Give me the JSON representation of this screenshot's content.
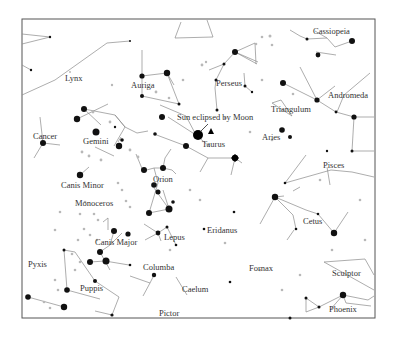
{
  "map": {
    "type": "star chart",
    "annotation": "Sun eclipsed by Moon",
    "frame": {
      "x": 22,
      "y": 19,
      "w": 353,
      "h": 299
    },
    "constellations": [
      {
        "name": "Cassiopeia",
        "x": 313,
        "y": 32
      },
      {
        "name": "Lynx",
        "x": 65,
        "y": 80
      },
      {
        "name": "Auriga",
        "x": 132,
        "y": 87
      },
      {
        "name": "Perseus",
        "x": 217,
        "y": 84
      },
      {
        "name": "Andromeda",
        "x": 328,
        "y": 97
      },
      {
        "name": "Triangulum",
        "x": 272,
        "y": 111
      },
      {
        "name": "Cancer",
        "x": 34,
        "y": 139
      },
      {
        "name": "Gemini",
        "x": 83,
        "y": 143
      },
      {
        "name": "Taurus",
        "x": 200,
        "y": 146
      },
      {
        "name": "Aries",
        "x": 262,
        "y": 139
      },
      {
        "name": "Pisces",
        "x": 323,
        "y": 167
      },
      {
        "name": "Canis Minor",
        "x": 62,
        "y": 187
      },
      {
        "name": "Orion",
        "x": 153,
        "y": 182
      },
      {
        "name": "Monoceros",
        "x": 76,
        "y": 205
      },
      {
        "name": "Eridanus",
        "x": 207,
        "y": 232
      },
      {
        "name": "Cetus",
        "x": 303,
        "y": 223
      },
      {
        "name": "Lepus",
        "x": 164,
        "y": 239
      },
      {
        "name": "Canis Major",
        "x": 95,
        "y": 244
      },
      {
        "name": "Pyxis",
        "x": 28,
        "y": 266
      },
      {
        "name": "Columba",
        "x": 143,
        "y": 270
      },
      {
        "name": "Fornax",
        "x": 249,
        "y": 270
      },
      {
        "name": "Sculptor",
        "x": 332,
        "y": 275
      },
      {
        "name": "Puppis",
        "x": 80,
        "y": 291
      },
      {
        "name": "Caelum",
        "x": 182,
        "y": 292
      },
      {
        "name": "Phoenix",
        "x": 329,
        "y": 311
      },
      {
        "name": "Pictor",
        "x": 159,
        "y": 316
      }
    ]
  }
}
